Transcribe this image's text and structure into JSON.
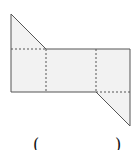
{
  "figure": {
    "fill_color": "#f2f2f2",
    "edge_color": "#555555",
    "fold_color": "#555555",
    "left_triangle": [
      [
        11,
        14
      ],
      [
        11,
        49
      ],
      [
        46,
        49
      ]
    ],
    "right_triangle": [
      [
        96,
        92
      ],
      [
        130,
        92
      ],
      [
        130,
        126
      ]
    ],
    "rect": {
      "x": 11,
      "y": 49,
      "width": 119,
      "height": 43
    },
    "fold_lines_x": [
      46,
      96
    ]
  },
  "answer_blank": {
    "open": "(",
    "close": ")"
  }
}
